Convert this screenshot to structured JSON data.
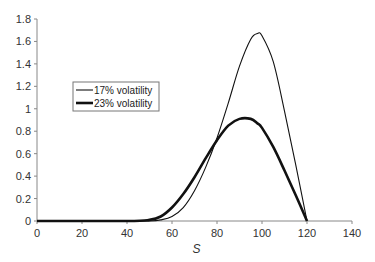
{
  "chart_data": {
    "type": "line",
    "title": "",
    "xlabel": "S",
    "ylabel": "",
    "xlim": [
      0,
      140
    ],
    "ylim": [
      0,
      1.8
    ],
    "x_ticks": [
      "0",
      "20",
      "40",
      "60",
      "80",
      "100",
      "120",
      "140"
    ],
    "y_ticks": [
      "0",
      "0.2",
      "0.4",
      "0.6",
      "0.8",
      "1",
      "1.2",
      "1.4",
      "1.6",
      "1.8"
    ],
    "grid": false,
    "legend_position": "upper-left (inside)",
    "x": [
      0,
      40,
      50,
      55,
      60,
      65,
      70,
      75,
      80,
      85,
      90,
      95,
      98,
      100,
      105,
      110,
      115,
      120
    ],
    "series": [
      {
        "name": "17% volatility",
        "line_width": "thin",
        "values": [
          0,
          0,
          0,
          0.01,
          0.04,
          0.12,
          0.27,
          0.48,
          0.74,
          1.05,
          1.38,
          1.62,
          1.67,
          1.65,
          1.42,
          0.98,
          0.5,
          0
        ]
      },
      {
        "name": "23% volatility",
        "line_width": "thick",
        "values": [
          0,
          0,
          0.01,
          0.04,
          0.12,
          0.24,
          0.39,
          0.56,
          0.72,
          0.85,
          0.91,
          0.91,
          0.87,
          0.83,
          0.66,
          0.45,
          0.23,
          0
        ]
      }
    ]
  }
}
